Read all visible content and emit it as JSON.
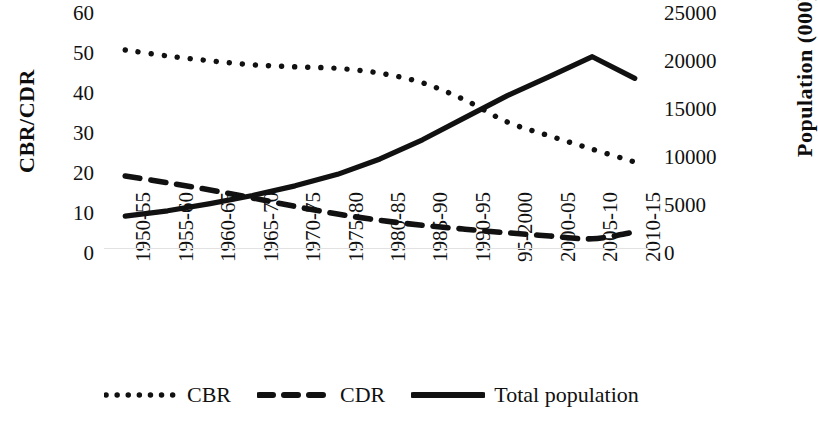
{
  "chart_data": {
    "type": "line",
    "title": "",
    "xlabel": "",
    "ylabel": "CBR/CDR",
    "y2label": "Population (000)",
    "grid": false,
    "legend_position": "bottom",
    "categories": [
      "1950-55",
      "1955-60",
      "1960-65",
      "1965-70",
      "1970-75",
      "1975-80",
      "1980-85",
      "1985-90",
      "1990-95",
      "95-2000",
      "2000-05",
      "2005-10",
      "2010-15"
    ],
    "ylim": [
      0,
      60
    ],
    "yticks": [
      0,
      10,
      20,
      30,
      40,
      50,
      60
    ],
    "y2lim": [
      0,
      25000
    ],
    "y2ticks": [
      0,
      5000,
      10000,
      15000,
      20000,
      25000
    ],
    "series": [
      {
        "name": "CBR",
        "axis": "left",
        "style": "dotted",
        "color": "#111111",
        "values": [
          51.0,
          49.5,
          48.3,
          47.3,
          46.8,
          46.4,
          45.2,
          42.8,
          38.5,
          33.0,
          29.5,
          26.2,
          23.0
        ]
      },
      {
        "name": "CDR",
        "axis": "left",
        "style": "dashed",
        "color": "#111111",
        "values": [
          19.5,
          17.8,
          16.0,
          14.0,
          11.9,
          10.0,
          8.4,
          7.2,
          6.2,
          5.3,
          4.5,
          3.8,
          5.5
        ]
      },
      {
        "name": "Total population",
        "axis": "right",
        "style": "solid",
        "color": "#111111",
        "values": [
          3950,
          4500,
          5250,
          6100,
          7100,
          8300,
          9900,
          11900,
          14200,
          16500,
          18500,
          20550,
          18300
        ]
      }
    ]
  },
  "axes": {
    "left_title": "CBR/CDR",
    "right_title": "Population (000)",
    "left_ticks": [
      "60",
      "50",
      "40",
      "30",
      "20",
      "10",
      "0"
    ],
    "right_ticks": [
      "25000",
      "20000",
      "15000",
      "10000",
      "5000",
      "0"
    ],
    "x_ticks": [
      "1950-55",
      "1955-60",
      "1960-65",
      "1965-70",
      "1970-75",
      "1975-80",
      "1980-85",
      "1985-90",
      "1990-95",
      "95-2000",
      "2000-05",
      "2005-10",
      "2010-15"
    ]
  },
  "legend": {
    "items": [
      {
        "label": "CBR",
        "style": "dotted"
      },
      {
        "label": "CDR",
        "style": "dashed"
      },
      {
        "label": "Total population",
        "style": "solid"
      }
    ]
  }
}
